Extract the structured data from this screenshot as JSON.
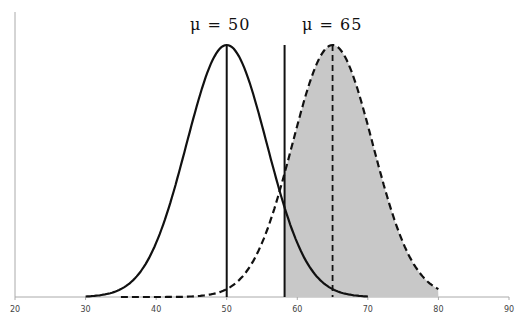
{
  "chart_data": {
    "type": "line",
    "title": "",
    "xlabel": "",
    "ylabel": "",
    "xlim": [
      20,
      90
    ],
    "x_ticks": [
      20,
      30,
      40,
      50,
      60,
      70,
      80,
      90
    ],
    "grid": false,
    "legend": null,
    "series": [
      {
        "name": "Null distribution (mu = 50)",
        "style": "solid",
        "mean": 50,
        "sd": 5.7,
        "x_range": [
          30,
          70
        ],
        "color": "#111111"
      },
      {
        "name": "Alternative distribution (mu = 65)",
        "style": "dashed",
        "mean": 65,
        "sd": 5.7,
        "x_range": [
          35,
          80
        ],
        "color": "#111111"
      }
    ],
    "vertical_lines": [
      {
        "x": 50,
        "style": "solid",
        "role": "mean of null"
      },
      {
        "x": 58.2,
        "style": "solid",
        "role": "critical value"
      },
      {
        "x": 65,
        "style": "dashed",
        "role": "mean of alternative"
      }
    ],
    "shaded_region": {
      "series": "Alternative distribution (mu = 65)",
      "from": 58.2,
      "to": 80,
      "color": "#c8c8c8"
    },
    "annotations": [
      {
        "text": "μ = 50",
        "x": 50
      },
      {
        "text": "μ = 65",
        "x": 65
      }
    ]
  },
  "labels": {
    "mu50": "μ  =  50",
    "mu65": "μ  =  65"
  }
}
